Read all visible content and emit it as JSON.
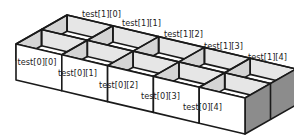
{
  "diagram": {
    "type": "2d-array-isometric",
    "rows": 2,
    "cols": 5,
    "front_row_labels": [
      "test[0][0]",
      "test[0][1]",
      "test[0][2]",
      "test[0][3]",
      "test[0][4]"
    ],
    "back_row_labels": [
      "test[1][0]",
      "test[1][1]",
      "test[1][2]",
      "test[1][3]",
      "test[1][4]"
    ],
    "colors": {
      "front_face": "#ffffff",
      "inner_light": "#e6e6e6",
      "inner_mid": "#d4d4d4",
      "side_face": "#8c8c8c",
      "stroke": "#1a1a1a",
      "background": "#ffffff"
    }
  }
}
